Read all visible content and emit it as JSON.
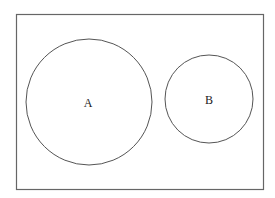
{
  "diagram": {
    "type": "venn-disjoint",
    "universe": {
      "x": 16,
      "y": 14,
      "width": 247,
      "height": 175
    },
    "sets": [
      {
        "label": "A",
        "cx": 89,
        "cy": 102,
        "r": 63
      },
      {
        "label": "B",
        "cx": 209,
        "cy": 99,
        "r": 44
      }
    ],
    "stroke_color": "#555555"
  }
}
